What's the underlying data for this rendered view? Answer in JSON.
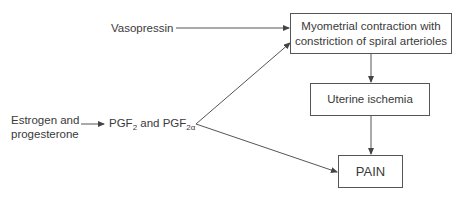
{
  "diagram": {
    "nodes": {
      "vasopressin": "Vasopressin",
      "estrogen_line1": "Estrogen and",
      "estrogen_line2": "progesterone",
      "pgf_main": "PGF",
      "pgf_sub1": "2",
      "pgf_and": " and PGF",
      "pgf_sub2": "2α",
      "myometrial_line1": "Myometrial contraction with",
      "myometrial_line2": "constriction of spiral arterioles",
      "ischemia": "Uterine ischemia",
      "pain": "PAIN"
    },
    "edges": [
      {
        "from": "Vasopressin",
        "to": "Myometrial contraction with constriction of spiral arterioles"
      },
      {
        "from": "Estrogen and progesterone",
        "to": "PGF2 and PGF2α"
      },
      {
        "from": "PGF2 and PGF2α",
        "to": "Myometrial contraction with constriction of spiral arterioles"
      },
      {
        "from": "PGF2 and PGF2α",
        "to": "PAIN"
      },
      {
        "from": "Myometrial contraction with constriction of spiral arterioles",
        "to": "Uterine ischemia"
      },
      {
        "from": "Uterine ischemia",
        "to": "PAIN"
      }
    ],
    "colors": {
      "line": "#555555",
      "text": "#3a3a3a"
    }
  }
}
